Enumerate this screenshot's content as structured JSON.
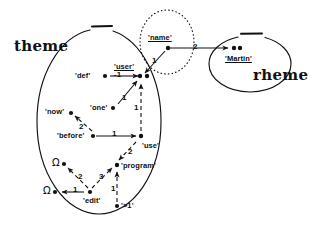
{
  "figure": {
    "background": "#ffffff",
    "ink": "#111111",
    "regions": [
      {
        "id": "theme",
        "label": "theme",
        "shape": "ellipse",
        "style": "solid-with-top-gap"
      },
      {
        "id": "rheme",
        "label": "rheme",
        "shape": "ellipse",
        "style": "solid-with-top-gap"
      },
      {
        "id": "name",
        "label": "",
        "shape": "ellipse",
        "style": "dotted"
      }
    ]
  },
  "nodes": [
    {
      "id": "def",
      "label": "'def'",
      "label_pos": "left",
      "underline": false,
      "x": 143,
      "y": 76
    },
    {
      "id": "user",
      "label": "'user'",
      "label_pos": "above",
      "underline": true,
      "x": 210,
      "y": 76
    },
    {
      "id": "user2",
      "label": "",
      "label_pos": "none",
      "underline": false,
      "x": 219,
      "y": 76
    },
    {
      "id": "name",
      "label": "'name'",
      "label_pos": "above",
      "underline": true,
      "x": 255,
      "y": 48
    },
    {
      "id": "martin",
      "label": "'Martin'",
      "label_pos": "below",
      "underline": true,
      "x": 352,
      "y": 48
    },
    {
      "id": "martin2",
      "label": "",
      "label_pos": "none",
      "underline": false,
      "x": 360,
      "y": 48
    },
    {
      "id": "one",
      "label": "'one'",
      "label_pos": "left",
      "underline": false,
      "x": 170,
      "y": 108
    },
    {
      "id": "now",
      "label": "'now'",
      "label_pos": "left",
      "underline": false,
      "x": 106,
      "y": 113
    },
    {
      "id": "before",
      "label": "'before'",
      "label_pos": "left",
      "underline": false,
      "x": 146,
      "y": 136
    },
    {
      "id": "use",
      "label": "'use'",
      "label_pos": "below",
      "underline": false,
      "x": 215,
      "y": 136
    },
    {
      "id": "program",
      "label": "'program'",
      "label_pos": "right",
      "underline": false,
      "x": 179,
      "y": 165
    },
    {
      "id": "omega1",
      "label": "Ω",
      "label_pos": "left",
      "underline": false,
      "x": 96,
      "y": 164
    },
    {
      "id": "omega2",
      "label": "Ω",
      "label_pos": "left",
      "underline": false,
      "x": 82,
      "y": 192
    },
    {
      "id": "edit",
      "label": "'edit'",
      "label_pos": "below",
      "underline": false,
      "x": 141,
      "y": 192
    },
    {
      "id": "gt1",
      "label": "'>1'",
      "label_pos": "right",
      "underline": false,
      "x": 178,
      "y": 206
    }
  ],
  "edges": [
    {
      "from": "def",
      "to": "user",
      "label": "-1",
      "style": "solid",
      "arrow": true
    },
    {
      "from": "name",
      "to": "user",
      "label": "1",
      "style": "solid",
      "arrow": true
    },
    {
      "from": "name",
      "to": "martin",
      "label": "2",
      "style": "solid",
      "arrow": true
    },
    {
      "from": "one",
      "to": "user",
      "label": "1",
      "style": "solid",
      "arrow": true
    },
    {
      "from": "use",
      "to": "user",
      "label": "1",
      "style": "dashed",
      "arrow": true
    },
    {
      "from": "before",
      "to": "now",
      "label": "2",
      "style": "dashed",
      "arrow": true
    },
    {
      "from": "before",
      "to": "use",
      "label": "1",
      "style": "solid",
      "arrow": true
    },
    {
      "from": "use",
      "to": "program",
      "label": "2",
      "style": "dashed",
      "arrow": true
    },
    {
      "from": "edit",
      "to": "omega1",
      "label": "2",
      "style": "dashed",
      "arrow": true
    },
    {
      "from": "edit",
      "to": "omega2",
      "label": "1",
      "style": "solid",
      "arrow": true
    },
    {
      "from": "edit",
      "to": "program",
      "label": "3",
      "style": "dashed",
      "arrow": true
    },
    {
      "from": "gt1",
      "to": "program",
      "label": "1",
      "style": "dashed",
      "arrow": true
    }
  ],
  "labels": {
    "theme": "theme",
    "rheme": "rheme",
    "def": "'def'",
    "user": "'user'",
    "name": "'name'",
    "martin": "'Martin'",
    "one": "'one'",
    "now": "'now'",
    "before": "'before'",
    "use": "'use'",
    "program": "'program'",
    "omega1": "Ω",
    "omega2": "Ω",
    "edit": "'edit'",
    "gt1": "'>1'"
  },
  "arc_labels": {
    "def_user": "-1",
    "name_user": "1",
    "name_martin": "2",
    "one_user": "1",
    "use_user": "1",
    "before_now": "2",
    "before_use": "1",
    "use_program": "2",
    "edit_omega1": "2",
    "edit_omega2": "1",
    "edit_program": "3",
    "gt1_program": "1"
  }
}
